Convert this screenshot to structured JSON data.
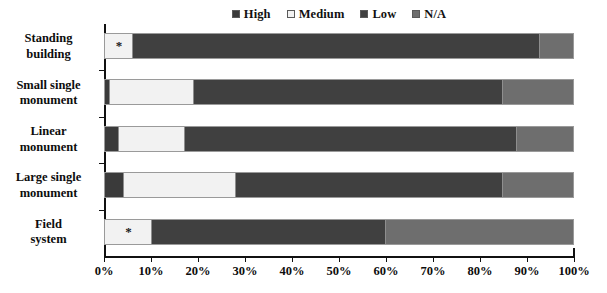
{
  "chart_data": {
    "type": "bar",
    "orientation": "horizontal",
    "stacked": true,
    "normalized": true,
    "title": "",
    "subtitle": "",
    "xlabel": "",
    "ylabel": "",
    "xlim": [
      0,
      100
    ],
    "xtick_labels": [
      "0%",
      "10%",
      "20%",
      "30%",
      "40%",
      "50%",
      "60%",
      "70%",
      "80%",
      "90%",
      "100%"
    ],
    "xtick_values": [
      0,
      10,
      20,
      30,
      40,
      50,
      60,
      70,
      80,
      90,
      100
    ],
    "grid": false,
    "legend_position": "top-center",
    "categories": [
      "Standing building",
      "Small single monument",
      "Linear monument",
      "Large single monument",
      "Field system"
    ],
    "category_lines": [
      [
        "Standing",
        "building"
      ],
      [
        "Small single",
        "monument"
      ],
      [
        "Linear",
        "monument"
      ],
      [
        "Large single",
        "monument"
      ],
      [
        "Field",
        "system"
      ]
    ],
    "series": [
      {
        "name": "High",
        "color": "#3a3a3a",
        "values": [
          0,
          1,
          3,
          4,
          0
        ]
      },
      {
        "name": "Medium",
        "color": "#f2f2f2",
        "values": [
          6,
          18,
          14,
          24,
          10
        ]
      },
      {
        "name": "Low",
        "color": "#404040",
        "values": [
          87,
          66,
          71,
          57,
          50
        ]
      },
      {
        "name": "N/A",
        "color": "#6e6e6e",
        "values": [
          7,
          15,
          12,
          15,
          40
        ]
      }
    ],
    "annotations": [
      {
        "category": "Standing building",
        "series": "Medium",
        "marker": "*"
      },
      {
        "category": "Field system",
        "series": "Medium",
        "marker": "*"
      }
    ],
    "marker_glyph": "*"
  },
  "legend": {
    "items": [
      {
        "label": "High",
        "color": "#3a3a3a"
      },
      {
        "label": "Medium",
        "color": "#f2f2f2"
      },
      {
        "label": "Low",
        "color": "#404040"
      },
      {
        "label": "N/A",
        "color": "#6e6e6e"
      }
    ]
  },
  "colors": {
    "high": "#3a3a3a",
    "medium": "#f2f2f2",
    "low": "#404040",
    "na": "#6e6e6e",
    "axis": "#111111",
    "text": "#0d0d0d",
    "background": "#ffffff"
  }
}
